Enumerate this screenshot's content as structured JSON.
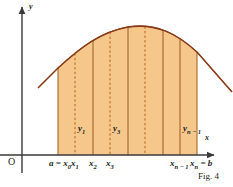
{
  "figure": {
    "caption": "Fig. 4",
    "axis_labels": {
      "x": "x",
      "y": "y",
      "origin": "O"
    },
    "colors": {
      "fill": "#F5C78B",
      "curve": "#8C3A16",
      "partition_line": "#9C5A20",
      "dashed_line": "#B5651D",
      "axis": "#3A3A3A",
      "tail_curve": "#3A3A3A",
      "text": "#231f20"
    },
    "x_ticks": [
      {
        "name": "a",
        "label_prefix": "a = ",
        "base": "x",
        "sub": "0",
        "x": 58,
        "type": "solid"
      },
      {
        "name": "x1",
        "label_prefix": "",
        "base": "x",
        "sub": "1",
        "x": 75,
        "type": "dashed"
      },
      {
        "name": "x2",
        "label_prefix": "",
        "base": "x",
        "sub": "2",
        "x": 93,
        "type": "solid"
      },
      {
        "name": "x3",
        "label_prefix": "",
        "base": "x",
        "sub": "3",
        "x": 110,
        "type": "dashed"
      },
      {
        "name": "xn1",
        "label_prefix": "",
        "base": "x",
        "sub": "n − 1",
        "x": 180,
        "type": "solid"
      },
      {
        "name": "xn",
        "label_prefix": "",
        "base": "x",
        "sub": "n",
        "label_suffix": " = b",
        "x": 197,
        "type": "solid"
      }
    ],
    "interior_lines": [
      {
        "x": 128,
        "type": "solid"
      },
      {
        "x": 145,
        "type": "dashed"
      },
      {
        "x": 163,
        "type": "solid"
      }
    ],
    "ordinates": [
      {
        "base": "y",
        "sub": "1",
        "x": 78,
        "y": 124
      },
      {
        "base": "y",
        "sub": "3",
        "x": 113,
        "y": 124
      },
      {
        "base": "y",
        "sub": "n − 1",
        "x": 183,
        "y": 124
      }
    ],
    "geometry": {
      "x_axis_y": 155,
      "y_axis_x": 22,
      "region_left": 58,
      "region_right": 197,
      "curve_path": "M 38,88 L 58,68 C 80,48 100,32 128,27 C 156,23 176,33 197,52 L 232,92",
      "region_path": "M 58,155 L 58,68 C 80,48 100,32 128,27 C 156,23 176,33 197,52 L 197,155 Z",
      "tail_left_end_x": 38,
      "tail_right_end_x": 232
    },
    "chart_data": {
      "type": "area",
      "title": "Fig. 4",
      "xlabel": "x",
      "ylabel": "y",
      "description": "Riemann sum partition of the region under a concave curve between a and b",
      "partition_points": [
        "a = x0",
        "x1",
        "x2",
        "x3",
        "x(n-1)",
        "xn = b"
      ],
      "ordinate_labels": [
        "y1",
        "y3",
        "y(n-1)"
      ],
      "n_subintervals": 8,
      "grid": false,
      "legend": "none"
    }
  }
}
